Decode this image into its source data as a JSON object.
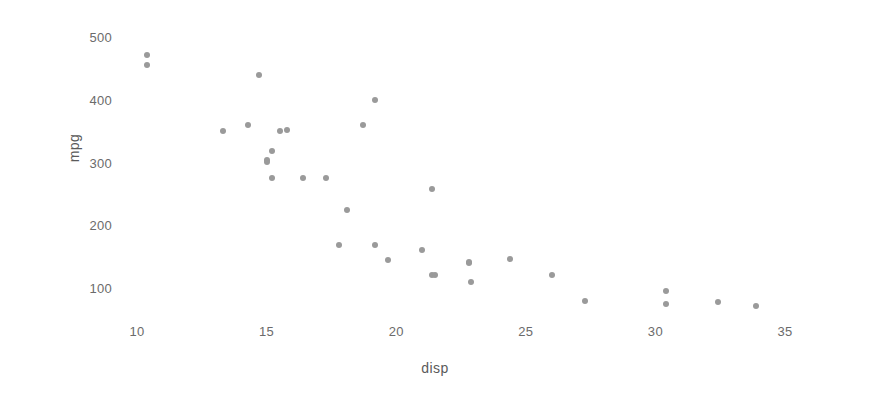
{
  "chart_data": {
    "type": "scatter",
    "title": "",
    "xlabel": "disp",
    "ylabel": "mpg",
    "xlim": [
      8.4,
      36.0
    ],
    "ylim": [
      55,
      520
    ],
    "xticks": [
      10,
      15,
      20,
      25,
      30,
      35
    ],
    "yticks": [
      100,
      200,
      300,
      400,
      500
    ],
    "grid": false,
    "legend": null,
    "marker_color": "#9a9a9a",
    "marker_size": 6,
    "background": "#ffffff",
    "points": [
      {
        "x": 10.4,
        "y": 472
      },
      {
        "x": 10.4,
        "y": 456
      },
      {
        "x": 13.3,
        "y": 350
      },
      {
        "x": 14.3,
        "y": 360
      },
      {
        "x": 14.7,
        "y": 440
      },
      {
        "x": 15.0,
        "y": 301
      },
      {
        "x": 15.0,
        "y": 304
      },
      {
        "x": 15.2,
        "y": 276
      },
      {
        "x": 15.2,
        "y": 318
      },
      {
        "x": 15.5,
        "y": 350
      },
      {
        "x": 15.8,
        "y": 351
      },
      {
        "x": 16.4,
        "y": 276
      },
      {
        "x": 17.3,
        "y": 276
      },
      {
        "x": 17.8,
        "y": 168
      },
      {
        "x": 18.1,
        "y": 225
      },
      {
        "x": 18.7,
        "y": 360
      },
      {
        "x": 19.2,
        "y": 400
      },
      {
        "x": 19.2,
        "y": 168
      },
      {
        "x": 19.7,
        "y": 145
      },
      {
        "x": 21.0,
        "y": 160
      },
      {
        "x": 21.4,
        "y": 258
      },
      {
        "x": 21.4,
        "y": 121
      },
      {
        "x": 21.5,
        "y": 120
      },
      {
        "x": 22.8,
        "y": 141
      },
      {
        "x": 22.8,
        "y": 140
      },
      {
        "x": 22.9,
        "y": 110
      },
      {
        "x": 24.4,
        "y": 147
      },
      {
        "x": 26.0,
        "y": 120
      },
      {
        "x": 27.3,
        "y": 79
      },
      {
        "x": 30.4,
        "y": 95
      },
      {
        "x": 30.4,
        "y": 75
      },
      {
        "x": 32.4,
        "y": 78
      },
      {
        "x": 33.9,
        "y": 71
      }
    ]
  }
}
